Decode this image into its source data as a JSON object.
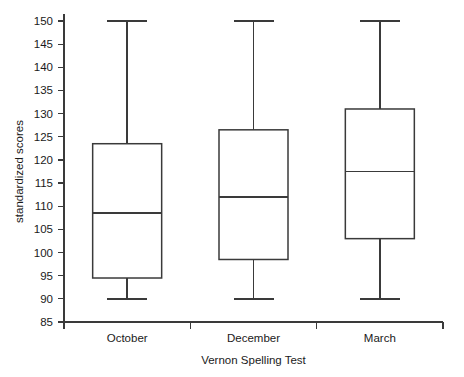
{
  "chart_data": {
    "type": "boxplot",
    "title": "",
    "xlabel": "Vernon Spelling Test",
    "ylabel": "standardized scores",
    "categories": [
      "October",
      "December",
      "March"
    ],
    "ylim": [
      85,
      150
    ],
    "yticks": [
      85,
      90,
      95,
      100,
      105,
      110,
      115,
      120,
      125,
      130,
      135,
      140,
      145,
      150
    ],
    "ytick_labels": [
      "85",
      "90",
      "95",
      "100",
      "105",
      "110",
      "115",
      "120",
      "125",
      "130",
      "135",
      "140",
      "145",
      "150"
    ],
    "grid": false,
    "legend": null,
    "boxes": [
      {
        "category": "October",
        "min": 90,
        "q1": 94.5,
        "median": 108.5,
        "q3": 123.5,
        "max": 150,
        "outliers": []
      },
      {
        "category": "December",
        "min": 90,
        "q1": 98.5,
        "median": 112,
        "q3": 126.5,
        "max": 150,
        "outliers": []
      },
      {
        "category": "March",
        "min": 90,
        "q1": 103,
        "median": 117.5,
        "q3": 131,
        "max": 150,
        "outliers": []
      }
    ],
    "colors": {
      "line": "#3a3a3a",
      "box_fill": "#ffffff",
      "text": "#1a1a1a",
      "background": "#ffffff"
    }
  }
}
